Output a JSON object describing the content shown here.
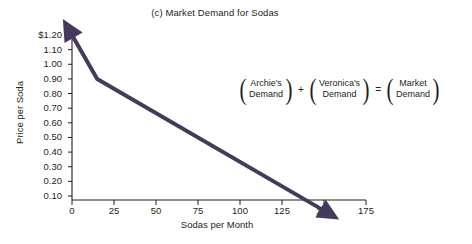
{
  "chart_data": {
    "type": "line",
    "title": "(c) Market Demand for Sodas",
    "xlabel": "Sodas per Month",
    "ylabel": "Price per Soda",
    "xlim": [
      0,
      175
    ],
    "ylim": [
      0,
      1.25
    ],
    "grid": false,
    "legend": "none",
    "xticks": [
      "0",
      "25",
      "50",
      "75",
      "100",
      "125",
      "150",
      "175"
    ],
    "xtick_values": [
      0,
      25,
      50,
      75,
      100,
      125,
      150,
      175
    ],
    "yticks": [
      "$1.20",
      "1.10",
      "1.00",
      "0.90",
      "0.80",
      "0.70",
      "0.60",
      "0.50",
      "0.40",
      "0.30",
      "0.20",
      "0.10"
    ],
    "ytick_values": [
      1.2,
      1.1,
      1.0,
      0.9,
      0.8,
      0.7,
      0.6,
      0.5,
      0.4,
      0.3,
      0.2,
      0.1
    ],
    "series": [
      {
        "name": "Market Demand",
        "color": "#453a5e",
        "x": [
          0,
          15,
          150
        ],
        "values": [
          1.2,
          0.9,
          0.0
        ]
      }
    ],
    "annotations": [
      {
        "name": "market-demand-equation",
        "terms": [
          {
            "line1": "Archie's",
            "line2": "Demand"
          },
          {
            "line1": "Veronica's",
            "line2": "Demand"
          },
          {
            "line1": "Market",
            "line2": "Demand"
          }
        ],
        "operators": [
          "+",
          "="
        ]
      }
    ]
  },
  "colors": {
    "curve": "#453a5e",
    "axis": "#231f20",
    "background": "#ffffff"
  },
  "parens": {
    "open": "(",
    "close": ")"
  }
}
